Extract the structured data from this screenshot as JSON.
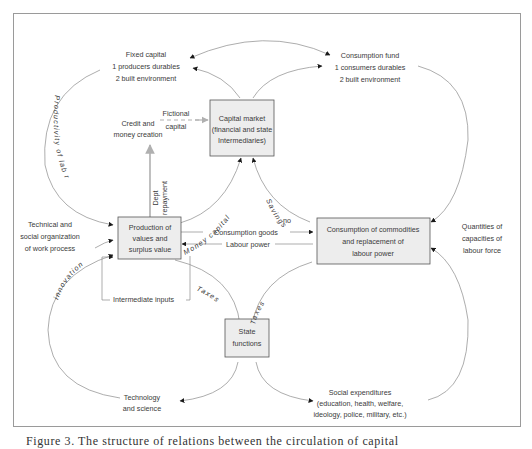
{
  "figure": {
    "caption": "Figure 3. The structure of relations between the circulation of capital"
  },
  "boxes": {
    "capital_market": [
      "Capital market",
      "(financial and state",
      "Intermediaries)"
    ],
    "production": [
      "Production of",
      "values and",
      "surplus value"
    ],
    "consumption": [
      "Consumption of commodities",
      "and replacement of",
      "labour power"
    ],
    "state": [
      "State",
      "functions"
    ]
  },
  "nodes": {
    "fixed_capital": [
      "Fixed capital",
      "1 producers durables",
      "2 built environment"
    ],
    "consumption_fund": [
      "Consumption fund",
      "1 consumers durables",
      "2 built environment"
    ],
    "credit": [
      "Credit  and",
      "money  creation"
    ],
    "fictional_capital": [
      "Fictional",
      "capital"
    ],
    "technical": [
      "Technical and",
      "social organization",
      "of work process"
    ],
    "quantities": [
      "Quantities of",
      "capacities of",
      "labour force"
    ],
    "technology": [
      "Technology",
      "and science"
    ],
    "social_exp": [
      "Social expenditures",
      "(education, health, welfare,",
      "ideology, police, military, etc.)"
    ]
  },
  "flows": {
    "productivity": "Productivity of lab   r",
    "innovation": "innovation",
    "dept_repayment_1": "Dept",
    "dept_repayment_2": "repayment",
    "money_capital": "Money capital",
    "savings": "Savings",
    "consumption_goods": "Consumption goods",
    "labour_power": "Labour power",
    "taxes_left": "Taxes",
    "taxes_right": "Taxes",
    "intermediate_inputs": "Intermediate inputs",
    "ou": "ou"
  },
  "colors": {
    "box_fill": "#ededed",
    "box_stroke": "#555555",
    "line": "#8a8a8a",
    "arrow": "#1a1a1a",
    "gray_arrow": "#b0b0b0",
    "frame": "#9a9a9a"
  }
}
